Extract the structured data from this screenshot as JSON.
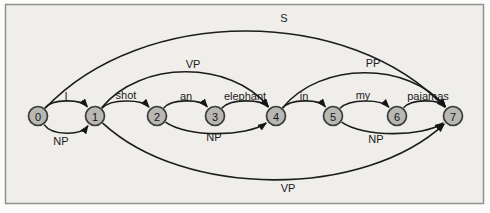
{
  "figure": {
    "canvas": {
      "width": 490,
      "height": 213
    },
    "frame": {
      "x": 5.5,
      "y": 4.5,
      "width": 478,
      "height": 199,
      "stroke": "#919191",
      "fill": "#efeeea"
    },
    "colors": {
      "page_background": "#fcfcfa",
      "edge_stroke": "#1c1c1c",
      "arrow_fill": "#161616",
      "node_fill": "#b8b7b4",
      "node_stroke": "#3a3a3a",
      "node_text": "#151515",
      "label_text": "#1a1a1a"
    },
    "geometry": {
      "baseline_y": 116,
      "node_radius": 9.5,
      "edge_width": 1.6,
      "label_font_size": 11,
      "node_font_size": 11
    },
    "nodes": [
      {
        "id": "0",
        "x": 38
      },
      {
        "id": "1",
        "x": 95
      },
      {
        "id": "2",
        "x": 157
      },
      {
        "id": "3",
        "x": 215
      },
      {
        "id": "4",
        "x": 276
      },
      {
        "id": "5",
        "x": 333
      },
      {
        "id": "6",
        "x": 397
      },
      {
        "id": "7",
        "x": 453
      }
    ],
    "edges": [
      {
        "from": "0",
        "to": "7",
        "label": "S",
        "arc": 83,
        "label_x": 284,
        "label_y": 18
      },
      {
        "from": "1",
        "to": "4",
        "label": "VP",
        "arc": 42,
        "label_x": 193,
        "label_y": 64
      },
      {
        "from": "4",
        "to": "7",
        "label": "PP",
        "arc": 41,
        "label_x": 373,
        "label_y": 63
      },
      {
        "from": "0",
        "to": "1",
        "label": "I",
        "arc": 13,
        "label_x": 66,
        "label_y": 96
      },
      {
        "from": "1",
        "to": "2",
        "label": "shot",
        "arc": 13,
        "label_x": 126,
        "label_y": 95
      },
      {
        "from": "2",
        "to": "3",
        "label": "an",
        "arc": 13,
        "label_x": 186,
        "label_y": 96
      },
      {
        "from": "3",
        "to": "4",
        "label": "elephant",
        "arc": 13,
        "label_x": 245,
        "label_y": 96
      },
      {
        "from": "4",
        "to": "5",
        "label": "in",
        "arc": 13,
        "label_x": 304,
        "label_y": 96
      },
      {
        "from": "5",
        "to": "6",
        "label": "my",
        "arc": 13,
        "label_x": 363,
        "label_y": 95
      },
      {
        "from": "6",
        "to": "7",
        "label": "pajamas",
        "arc": 13,
        "label_x": 428,
        "label_y": 96
      },
      {
        "from": "0",
        "to": "1",
        "label": "NP",
        "arc": -15,
        "label_x": 61,
        "label_y": 141
      },
      {
        "from": "2",
        "to": "4",
        "label": "NP",
        "arc": -16,
        "label_x": 214,
        "label_y": 137
      },
      {
        "from": "5",
        "to": "7",
        "label": "NP",
        "arc": -16,
        "label_x": 376,
        "label_y": 139
      },
      {
        "from": "1",
        "to": "7",
        "label": "VP",
        "arc": -62,
        "label_x": 288,
        "label_y": 188
      }
    ]
  }
}
